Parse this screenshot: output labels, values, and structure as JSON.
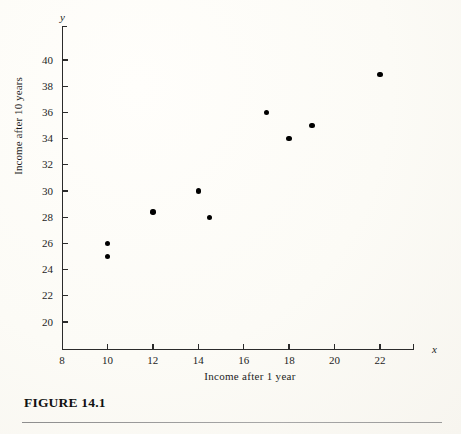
{
  "figure": {
    "caption": "FIGURE 14.1"
  },
  "axes": {
    "y_var_symbol": "y",
    "x_var_symbol": "x",
    "y_title": "Income after 10 years",
    "x_title": "Income after 1 year"
  },
  "chart_data": {
    "type": "scatter",
    "title": "",
    "xlabel": "Income after 1 year",
    "ylabel": "Income after 10 years",
    "xlim": [
      8,
      23
    ],
    "ylim": [
      18.5,
      41
    ],
    "grid": false,
    "legend": null,
    "xticks": [
      8,
      10,
      12,
      14,
      16,
      18,
      20,
      22
    ],
    "yticks": [
      20,
      22,
      24,
      26,
      28,
      30,
      32,
      34,
      36,
      38,
      40
    ],
    "xtick_labels": [
      "8",
      "10",
      "12",
      "14",
      "16",
      "18",
      "20",
      "22"
    ],
    "ytick_labels": [
      "20",
      "22",
      "24",
      "26",
      "28",
      "30",
      "32",
      "34",
      "36",
      "38",
      "40"
    ],
    "marker": "filled-circle",
    "marker_color": "#000000",
    "points": [
      {
        "x": 10,
        "y": 26
      },
      {
        "x": 10,
        "y": 25
      },
      {
        "x": 12,
        "y": 28.4
      },
      {
        "x": 14,
        "y": 30
      },
      {
        "x": 14.5,
        "y": 28
      },
      {
        "x": 17,
        "y": 36
      },
      {
        "x": 18,
        "y": 34
      },
      {
        "x": 19,
        "y": 35
      },
      {
        "x": 22,
        "y": 38.9
      }
    ]
  },
  "colors": {
    "ink": "#1d1d1d",
    "axis": "#2b2b2b",
    "marker": "#000000",
    "paper": "#fdfcf8",
    "rule": "#9a9a9a"
  }
}
